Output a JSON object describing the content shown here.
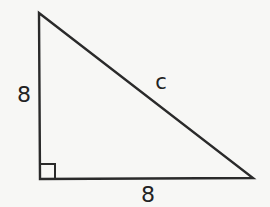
{
  "diagram": {
    "type": "right-triangle",
    "vertices": {
      "top": [
        39,
        13
      ],
      "right_angle": [
        40,
        179
      ],
      "right": [
        253,
        178
      ]
    },
    "right_angle_marker": true,
    "labels": {
      "vertical_leg": "8",
      "horizontal_leg": "8",
      "hypotenuse": "c"
    },
    "colors": {
      "stroke": "#2a2a2a",
      "background": "#f7f7f5"
    }
  }
}
